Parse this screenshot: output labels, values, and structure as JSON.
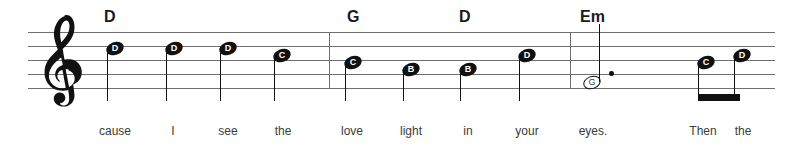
{
  "sheet": {
    "staff": {
      "left": 28,
      "right": 775,
      "line_ys": [
        32,
        46,
        60,
        74,
        88
      ],
      "line_color": "#6f6f72"
    },
    "clef": {
      "name": "treble-clef",
      "label": "Treble clef"
    },
    "barlines": [
      329,
      570
    ]
  },
  "chords": [
    {
      "label": "D",
      "x": 104
    },
    {
      "label": "G",
      "x": 347
    },
    {
      "label": "D",
      "x": 459
    },
    {
      "label": "Em",
      "x": 580
    }
  ],
  "notes": [
    {
      "pitch": "D",
      "x": 106,
      "y": 42,
      "head": "filled",
      "stem": "down",
      "dotted": false,
      "beamed": false
    },
    {
      "pitch": "D",
      "x": 165,
      "y": 42,
      "head": "filled",
      "stem": "down",
      "dotted": false,
      "beamed": false
    },
    {
      "pitch": "D",
      "x": 219,
      "y": 42,
      "head": "filled",
      "stem": "down",
      "dotted": false,
      "beamed": false
    },
    {
      "pitch": "C",
      "x": 273,
      "y": 49,
      "head": "filled",
      "stem": "down",
      "dotted": false,
      "beamed": false
    },
    {
      "pitch": "C",
      "x": 344,
      "y": 56,
      "head": "filled",
      "stem": "down",
      "dotted": false,
      "beamed": false
    },
    {
      "pitch": "B",
      "x": 402,
      "y": 63,
      "head": "filled",
      "stem": "down",
      "dotted": false,
      "beamed": false
    },
    {
      "pitch": "B",
      "x": 459,
      "y": 63,
      "head": "filled",
      "stem": "down",
      "dotted": false,
      "beamed": false
    },
    {
      "pitch": "D",
      "x": 518,
      "y": 49,
      "head": "filled",
      "stem": "down",
      "dotted": false,
      "beamed": false
    },
    {
      "pitch": "G",
      "x": 583,
      "y": 76,
      "head": "hollow",
      "stem": "up",
      "dotted": true,
      "beamed": false
    },
    {
      "pitch": "C",
      "x": 697,
      "y": 56,
      "head": "filled",
      "stem": "down",
      "dotted": false,
      "beamed": true
    },
    {
      "pitch": "D",
      "x": 733,
      "y": 49,
      "head": "filled",
      "stem": "down",
      "dotted": false,
      "beamed": true
    }
  ],
  "beam": {
    "x": 698,
    "y": 94,
    "width": 42,
    "height": 7
  },
  "dot": {
    "x": 609,
    "y": 71
  },
  "lyrics": [
    {
      "text": "cause",
      "x": 115
    },
    {
      "text": "I",
      "x": 173
    },
    {
      "text": "see",
      "x": 228
    },
    {
      "text": "the",
      "x": 283
    },
    {
      "text": "love",
      "x": 352
    },
    {
      "text": "light",
      "x": 411
    },
    {
      "text": "in",
      "x": 468
    },
    {
      "text": "your",
      "x": 527
    },
    {
      "text": "eyes.",
      "x": 593
    },
    {
      "text": "Then",
      "x": 703
    },
    {
      "text": "the",
      "x": 743
    }
  ]
}
